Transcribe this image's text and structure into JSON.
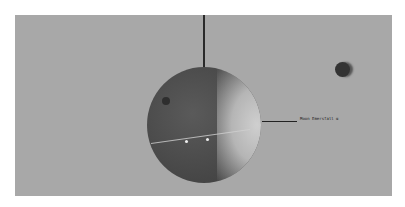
{
  "scene": {
    "background_color": "#a8a8a8",
    "moon": {
      "label": "Moon Emersfall α"
    },
    "small_body": {
      "color": "#333333"
    }
  }
}
